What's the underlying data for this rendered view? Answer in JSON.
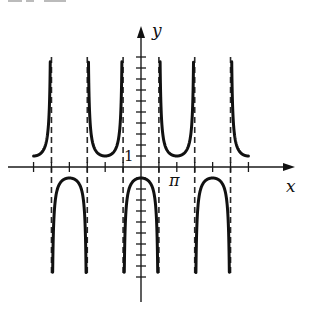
{
  "chart_data": {
    "type": "line",
    "title": "",
    "function": "y = -sec(x)",
    "xlabel": "x",
    "ylabel": "y",
    "tick_labels": {
      "x": [
        {
          "value": 3.14159,
          "label": "π"
        }
      ],
      "y": [
        {
          "value": 1,
          "label": "1"
        }
      ]
    },
    "x_tick_step": 1.5708,
    "y_tick_step": 1,
    "xlim": [
      -10.5,
      13.4
    ],
    "ylim": [
      -12.3,
      12.8
    ],
    "curve_clip": [
      -10,
      10
    ],
    "asymptotes_x": [
      -7.854,
      -4.712,
      -1.5708,
      1.5708,
      4.712,
      7.854
    ],
    "branch_vertices": [
      {
        "x": -9.4248,
        "y": 1
      },
      {
        "x": -6.2832,
        "y": -1
      },
      {
        "x": -3.1416,
        "y": 1
      },
      {
        "x": 0,
        "y": -1
      },
      {
        "x": 3.1416,
        "y": 1
      },
      {
        "x": 6.2832,
        "y": -1
      },
      {
        "x": 9.4248,
        "y": 1
      }
    ],
    "grid": false,
    "legend": null
  },
  "layout": {
    "origin_px": [
      141,
      167
    ],
    "px_per_x_unit": 11.4,
    "px_per_y_unit": 11.0,
    "x_axis_px": [
      8,
      295
    ],
    "y_axis_px": [
      302,
      26
    ],
    "x_ticks": [
      -6,
      -5,
      -4,
      -3,
      -2,
      -1,
      1,
      2,
      3,
      4,
      5,
      6
    ],
    "y_ticks_range": [
      -10,
      10
    ],
    "curve_x_range": [
      -9.4248,
      9.4248
    ]
  },
  "labels": {
    "x_axis": "x",
    "y_axis": "y",
    "pi": "π",
    "one": "1"
  }
}
